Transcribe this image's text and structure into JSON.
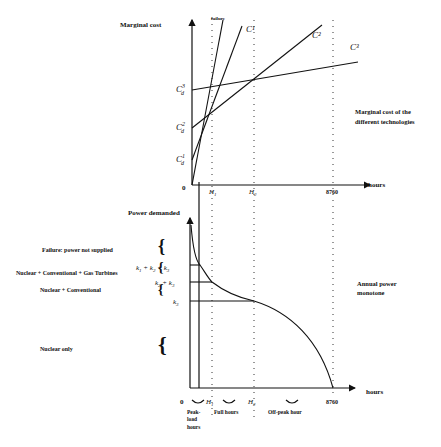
{
  "top_chart": {
    "y_axis_label": "Marginal cost",
    "x_axis_label": "hours",
    "origin": "0",
    "x_ticks": [
      "H1",
      "H2",
      "8760"
    ],
    "y_ticks": [
      "C_d^1",
      "C_d^2",
      "C_d^3"
    ],
    "curve_labels": [
      "failure",
      "C1",
      "C2",
      "C3"
    ],
    "annotation": [
      "Marginal cost of the",
      "different technologies"
    ]
  },
  "bottom_chart": {
    "y_axis_label": "Power demanded",
    "x_axis_label": "hours",
    "origin": "0",
    "x_ticks": [
      "H1",
      "H2",
      "8760"
    ],
    "levels": [
      "k1 + k2 + k3",
      "k2 + k3",
      "k3"
    ],
    "bands": [
      "Failure: power not supplied",
      "Nuclear + Conventional + Gas Turbines",
      "Nuclear + Conventional",
      "Nuclear only"
    ],
    "curve_label": [
      "Annual power",
      "monotone"
    ],
    "period_labels": [
      "Peak-",
      "load",
      "hours",
      "Full hours",
      "Off-peak hour"
    ]
  }
}
